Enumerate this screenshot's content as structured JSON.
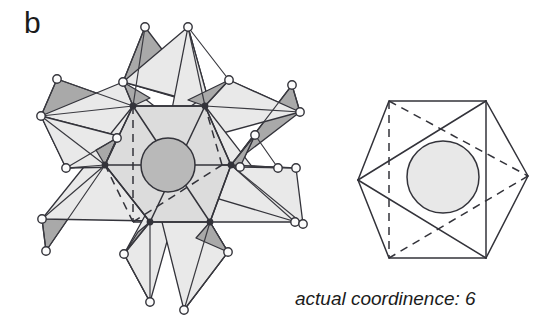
{
  "figure": {
    "panel_label": "b",
    "caption": "actual coordinence: 6",
    "background_color": "#ffffff",
    "stroke_color": "#33333a",
    "colors": {
      "octahedron_face_light": "#dcdcdc",
      "tetra_face_light": "#e9e9e9",
      "tetra_face_dark": "#a9a9a9",
      "central_sphere": "#b9b9b9",
      "atom_fill": "#fdfdfd",
      "outline": "#33333a"
    }
  },
  "left_cluster": {
    "name": "polyhedral-cluster-diagram",
    "description": "central octahedron with six outward coordinating tetrahedra",
    "center": [
      168,
      165
    ],
    "central_sphere": {
      "cx": 168,
      "cy": 165,
      "r": 27,
      "fill": "#b9b9b9"
    },
    "octahedron": {
      "front_vertices": [
        [
          133,
          106
        ],
        [
          205,
          106
        ],
        [
          105,
          165
        ],
        [
          231,
          165
        ],
        [
          150,
          222
        ],
        [
          210,
          222
        ]
      ],
      "rear_vertices": [
        [
          133,
          222
        ],
        [
          222,
          165
        ]
      ],
      "solid_edges": [
        [
          [
            133,
            106
          ],
          [
            205,
            106
          ]
        ],
        [
          [
            133,
            106
          ],
          [
            105,
            165
          ]
        ],
        [
          [
            205,
            106
          ],
          [
            231,
            165
          ]
        ],
        [
          [
            105,
            165
          ],
          [
            150,
            222
          ]
        ],
        [
          [
            231,
            165
          ],
          [
            210,
            222
          ]
        ],
        [
          [
            150,
            222
          ],
          [
            210,
            222
          ]
        ],
        [
          [
            133,
            106
          ],
          [
            210,
            222
          ]
        ],
        [
          [
            205,
            106
          ],
          [
            150,
            222
          ]
        ],
        [
          [
            105,
            165
          ],
          [
            231,
            165
          ]
        ]
      ],
      "dashed_edges": [
        [
          [
            133,
            106
          ],
          [
            133,
            222
          ]
        ],
        [
          [
            133,
            222
          ],
          [
            105,
            165
          ]
        ],
        [
          [
            133,
            222
          ],
          [
            222,
            165
          ]
        ],
        [
          [
            222,
            165
          ],
          [
            205,
            106
          ]
        ],
        [
          [
            222,
            165
          ],
          [
            231,
            165
          ]
        ],
        [
          [
            133,
            222
          ],
          [
            150,
            222
          ]
        ]
      ]
    },
    "outer_atoms": [
      [
        145,
        27
      ],
      [
        188,
        27
      ],
      [
        57,
        79
      ],
      [
        123,
        82
      ],
      [
        229,
        80
      ],
      [
        292,
        85
      ],
      [
        41,
        116
      ],
      [
        300,
        112
      ],
      [
        66,
        168
      ],
      [
        240,
        167
      ],
      [
        278,
        168
      ],
      [
        296,
        168
      ],
      [
        42,
        219
      ],
      [
        46,
        251
      ],
      [
        295,
        222
      ],
      [
        303,
        224
      ],
      [
        124,
        254
      ],
      [
        150,
        302
      ],
      [
        184,
        310
      ],
      [
        228,
        252
      ],
      [
        255,
        135
      ],
      [
        117,
        138
      ]
    ],
    "atom_radius": 4.2
  },
  "right_polyhedron": {
    "name": "octahedron-diagram",
    "description": "single octahedron, actual coordination environment",
    "center": [
      446,
      176
    ],
    "central_sphere": {
      "cx": 443,
      "cy": 177,
      "r": 36,
      "fill": "#e6e6e6"
    },
    "hexagon": [
      [
        389,
        101
      ],
      [
        486,
        101
      ],
      [
        528,
        176
      ],
      [
        486,
        258
      ],
      [
        389,
        258
      ],
      [
        358,
        180
      ]
    ],
    "solid_edges": [
      [
        [
          389,
          101
        ],
        [
          486,
          101
        ]
      ],
      [
        [
          486,
          101
        ],
        [
          528,
          176
        ]
      ],
      [
        [
          528,
          176
        ],
        [
          486,
          258
        ]
      ],
      [
        [
          486,
          258
        ],
        [
          389,
          258
        ]
      ],
      [
        [
          389,
          258
        ],
        [
          358,
          180
        ]
      ],
      [
        [
          358,
          180
        ],
        [
          389,
          101
        ]
      ],
      [
        [
          486,
          101
        ],
        [
          358,
          180
        ]
      ],
      [
        [
          358,
          180
        ],
        [
          486,
          258
        ]
      ],
      [
        [
          486,
          101
        ],
        [
          486,
          258
        ]
      ]
    ],
    "dashed_edges": [
      [
        [
          389,
          101
        ],
        [
          389,
          258
        ]
      ],
      [
        [
          389,
          101
        ],
        [
          528,
          176
        ]
      ],
      [
        [
          528,
          176
        ],
        [
          389,
          258
        ]
      ]
    ]
  }
}
